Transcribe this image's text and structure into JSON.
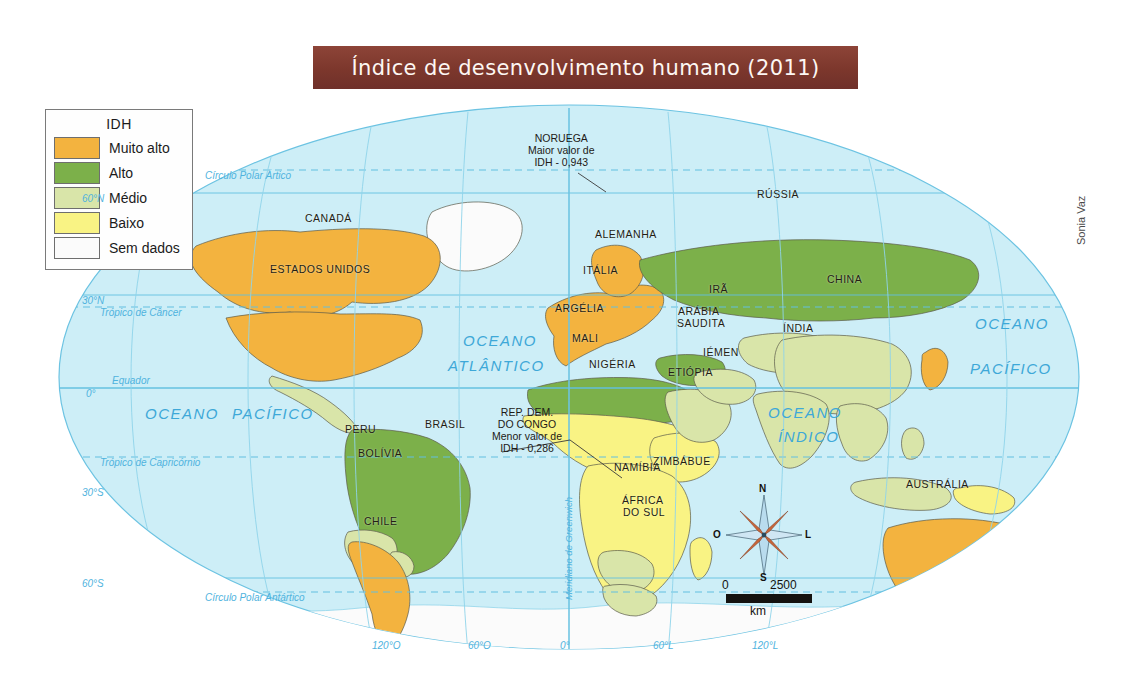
{
  "title": "Índice de desenvolvimento humano (2011)",
  "credit": "Sonia Vaz",
  "legend": {
    "title": "IDH",
    "items": [
      {
        "label": "Muito alto",
        "color": "#f3b33f"
      },
      {
        "label": "Alto",
        "color": "#7cb04a"
      },
      {
        "label": "Médio",
        "color": "#d9e5a9"
      },
      {
        "label": "Baixo",
        "color": "#f9f384"
      },
      {
        "label": "Sem dados",
        "color": "#fbfbfb"
      }
    ]
  },
  "callouts": {
    "max": {
      "l1": "NORUEGA",
      "l2": "Maior valor de",
      "l3": "IDH - 0,943"
    },
    "min": {
      "l1": "REP. DEM.",
      "l2": "DO CONGO",
      "l3": "Menor valor de",
      "l4": "IDH - 0,286"
    }
  },
  "countries": [
    {
      "name": "CANADÁ",
      "x": 305,
      "y": 212
    },
    {
      "name": "ESTADOS UNIDOS",
      "x": 270,
      "y": 263
    },
    {
      "name": "PERU",
      "x": 345,
      "y": 423
    },
    {
      "name": "BRASIL",
      "x": 425,
      "y": 418
    },
    {
      "name": "BOLÍVIA",
      "x": 358,
      "y": 447
    },
    {
      "name": "CHILE",
      "x": 364,
      "y": 515
    },
    {
      "name": "ALEMANHA",
      "x": 595,
      "y": 228
    },
    {
      "name": "ITÁLIA",
      "x": 583,
      "y": 264
    },
    {
      "name": "ARGÉLIA",
      "x": 555,
      "y": 302
    },
    {
      "name": "MALI",
      "x": 572,
      "y": 332
    },
    {
      "name": "NIGÉRIA",
      "x": 589,
      "y": 358
    },
    {
      "name": "ETIÓPIA",
      "x": 668,
      "y": 366
    },
    {
      "name": "IÉMEN",
      "x": 703,
      "y": 346
    },
    {
      "name": "ARÁBIA",
      "x": 678,
      "y": 305
    },
    {
      "name": "SAUDITA",
      "x": 677,
      "y": 317
    },
    {
      "name": "IRÃ",
      "x": 709,
      "y": 283
    },
    {
      "name": "RÚSSIA",
      "x": 757,
      "y": 188
    },
    {
      "name": "CHINA",
      "x": 827,
      "y": 273
    },
    {
      "name": "ÍNDIA",
      "x": 783,
      "y": 322
    },
    {
      "name": "NAMÍBIA",
      "x": 614,
      "y": 461
    },
    {
      "name": "ZIMBÁBUE",
      "x": 653,
      "y": 455
    },
    {
      "name": "ÁFRICA",
      "x": 622,
      "y": 494
    },
    {
      "name": "DO SUL",
      "x": 623,
      "y": 506
    },
    {
      "name": "AUSTRÁLIA",
      "x": 906,
      "y": 478
    }
  ],
  "oceans": [
    {
      "name": "OCEANO",
      "x": 463,
      "y": 332
    },
    {
      "name": "ATLÂNTICO",
      "x": 448,
      "y": 357
    },
    {
      "name": "OCEANO",
      "x": 145,
      "y": 405
    },
    {
      "name": "PACÍFICO",
      "x": 232,
      "y": 405
    },
    {
      "name": "OCEANO",
      "x": 768,
      "y": 404
    },
    {
      "name": "ÍNDICO",
      "x": 778,
      "y": 428
    },
    {
      "name": "OCEANO",
      "x": 975,
      "y": 315
    },
    {
      "name": "PACÍFICO",
      "x": 970,
      "y": 360
    }
  ],
  "graticule": {
    "latitudes": [
      {
        "label": "60°N",
        "x": 82,
        "y": 193
      },
      {
        "label": "30°N",
        "x": 82,
        "y": 295
      },
      {
        "label": "0°",
        "x": 86,
        "y": 388
      },
      {
        "label": "30°S",
        "x": 82,
        "y": 487
      },
      {
        "label": "60°S",
        "x": 82,
        "y": 578
      }
    ],
    "named_lines": [
      {
        "label": "Círculo Polar Ártico",
        "x": 205,
        "y": 170
      },
      {
        "label": "Trópico de Câncer",
        "x": 100,
        "y": 307
      },
      {
        "label": "Equador",
        "x": 112,
        "y": 375
      },
      {
        "label": "Trópico de Capricórnio",
        "x": 100,
        "y": 457
      },
      {
        "label": "Círculo Polar Antártico",
        "x": 205,
        "y": 592
      }
    ],
    "longitudes": [
      {
        "label": "120°O",
        "x": 372,
        "y": 640
      },
      {
        "label": "60°O",
        "x": 468,
        "y": 640
      },
      {
        "label": "0°",
        "x": 560,
        "y": 640
      },
      {
        "label": "60°L",
        "x": 653,
        "y": 640
      },
      {
        "label": "120°L",
        "x": 752,
        "y": 640
      }
    ],
    "meridian_label": "Meridiano de Greenwich"
  },
  "compass": {
    "n": "N",
    "s": "S",
    "e": "L",
    "w": "O"
  },
  "scale": {
    "min": "0",
    "max": "2500",
    "unit": "km"
  }
}
